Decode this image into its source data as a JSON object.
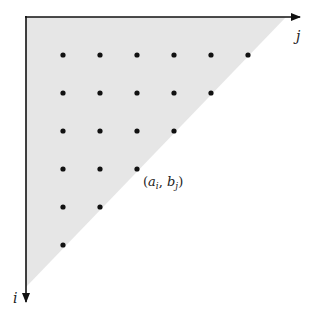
{
  "diagram": {
    "axes": {
      "horizontal_label": "j",
      "vertical_label": "i"
    },
    "point_label": "(aᵢ, bⱼ)",
    "point_label_parts": {
      "open": "(",
      "a": "a",
      "a_sub": "i",
      "comma": ", ",
      "b": "b",
      "b_sub": "j",
      "close": ")"
    },
    "region": {
      "shape": "triangle",
      "fill": "#e6e6e6"
    },
    "grid": {
      "rows": [
        6,
        5,
        4,
        3,
        2,
        1
      ],
      "dot_color": "#111111"
    }
  }
}
